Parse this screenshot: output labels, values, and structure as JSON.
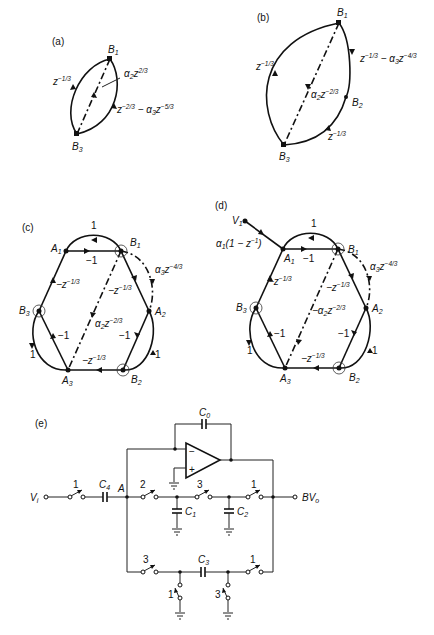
{
  "figure": {
    "panels": [
      {
        "id": "a",
        "label": "(a)",
        "nodes": [
          "B1",
          "B3"
        ],
        "edges": [
          {
            "from": "B3",
            "to": "B1",
            "gain": "z^(-1/3)",
            "style": "solid"
          },
          {
            "from": "B1",
            "to": "B3",
            "gain": "α2 z^(2/3)",
            "style": "dashed"
          },
          {
            "from": "B1",
            "to": "B3",
            "gain": "z^(-2/3) − α3 z^(-5/3)",
            "style": "solid"
          }
        ]
      },
      {
        "id": "b",
        "label": "(b)",
        "nodes": [
          "B1",
          "B2",
          "B3"
        ],
        "edges": [
          {
            "from": "B3",
            "to": "B1",
            "gain": "z^(-1/3)",
            "style": "solid"
          },
          {
            "from": "B1",
            "to": "B3",
            "gain": "α2 z^(-2/3)",
            "style": "dashed"
          },
          {
            "from": "B1",
            "to": "B2",
            "gain": "z^(-1/3) − α3 z^(-4/3)",
            "style": "solid"
          },
          {
            "from": "B2",
            "to": "B3",
            "gain": "z^(-1/3)",
            "style": "solid"
          }
        ]
      },
      {
        "id": "c",
        "label": "(c)",
        "nodes": [
          "A1",
          "A2",
          "A3",
          "B1",
          "B2",
          "B3"
        ],
        "circled_nodes": [
          "B1",
          "B2",
          "B3"
        ],
        "edges": [
          {
            "from": "A1",
            "to": "B1",
            "gain": "−1"
          },
          {
            "from": "B1",
            "to": "A1",
            "gain": "1"
          },
          {
            "from": "B1",
            "to": "A2",
            "gain": "−z^(-1/3)"
          },
          {
            "from": "B1",
            "to": "A2",
            "gain": "α3 z^(-4/3)",
            "style": "dashed"
          },
          {
            "from": "B1",
            "to": "A3",
            "gain": "α2 z^(-2/3)",
            "style": "dashed"
          },
          {
            "from": "A2",
            "to": "B2",
            "gain": "−1"
          },
          {
            "from": "B2",
            "to": "A2",
            "gain": "1"
          },
          {
            "from": "B2",
            "to": "A3",
            "gain": "−z^(-1/3)"
          },
          {
            "from": "A3",
            "to": "B3",
            "gain": "−1"
          },
          {
            "from": "B3",
            "to": "A3",
            "gain": "1"
          },
          {
            "from": "B3",
            "to": "A1",
            "gain": "−z^(-1/3)"
          }
        ]
      },
      {
        "id": "d",
        "label": "(d)",
        "nodes": [
          "V1",
          "A1",
          "A2",
          "A3",
          "B1",
          "B2",
          "B3"
        ],
        "circled_nodes": [
          "B1",
          "B2",
          "B3"
        ],
        "edges": [
          {
            "from": "V1",
            "to": "A1",
            "gain": "α1(1 − z^(-1))"
          },
          {
            "from": "A1",
            "to": "B1",
            "gain": "−1"
          },
          {
            "from": "B1",
            "to": "A1",
            "gain": "1"
          },
          {
            "from": "B1",
            "to": "A2",
            "gain": "−z^(-1/3)"
          },
          {
            "from": "B1",
            "to": "A2",
            "gain": "α3 z^(-4/3)",
            "style": "dashed"
          },
          {
            "from": "B1",
            "to": "A3",
            "gain": "−α2 z^(-2/3)",
            "style": "dashed"
          },
          {
            "from": "A2",
            "to": "B2",
            "gain": "−1"
          },
          {
            "from": "B2",
            "to": "A2",
            "gain": "1"
          },
          {
            "from": "B2",
            "to": "A3",
            "gain": "−z^(-1/3)"
          },
          {
            "from": "A3",
            "to": "B3",
            "gain": "−1"
          },
          {
            "from": "B3",
            "to": "A3",
            "gain": "1"
          },
          {
            "from": "B3",
            "to": "A1",
            "gain": "−z^(-1/3)"
          }
        ]
      },
      {
        "id": "e",
        "label": "(e)",
        "type": "switched-capacitor circuit",
        "input": "Vi",
        "output": "BVo",
        "node_label": "A",
        "capacitors": [
          "C0",
          "C1",
          "C2",
          "C3",
          "C4"
        ],
        "switch_phases": {
          "input_switch": "1",
          "a_to_c1": "2",
          "c1_to_c2": "3",
          "c2_to_out": "1",
          "bottom_left": "3",
          "bottom_right": "1",
          "c3_left_ground": "1",
          "c3_right_ground": "3"
        },
        "opamp_inputs": [
          "−",
          "+"
        ]
      }
    ]
  },
  "labels": {
    "a": {
      "panel": "(a)",
      "b1": "B",
      "b1s": "1",
      "b3": "B",
      "b3s": "3",
      "e1": "z",
      "e1p": "−1/3",
      "e2a": "α",
      "e2s": "2",
      "e2z": "z",
      "e2p": "2/3",
      "e3z": "z",
      "e3p": "−2/3",
      "e3m": " − α",
      "e3s": "3",
      "e3z2": "z",
      "e3p2": "−5/3"
    },
    "b": {
      "panel": "(b)",
      "b1": "B",
      "b1s": "1",
      "b2": "B",
      "b2s": "2",
      "b3": "B",
      "b3s": "3",
      "e1": "z",
      "e1p": "−1/3",
      "e2a": "α",
      "e2s": "2",
      "e2z": "z",
      "e2p": "−2/3",
      "e3z": "z",
      "e3p": "−1/3",
      "e3m": " − α",
      "e3s": "3",
      "e3z2": "z",
      "e3p2": "−4/3",
      "e4z": "z",
      "e4p": "−1/3"
    },
    "c": {
      "panel": "(c)",
      "A": "A",
      "B": "B",
      "s1": "1",
      "s2": "2",
      "s3": "3",
      "one": "1",
      "m1": "−1",
      "mz": "−z",
      "p13": "−1/3",
      "p43": "−4/3",
      "p23": "−2/3",
      "alpha": "α",
      "z": "z"
    },
    "d": {
      "panel": "(d)",
      "A": "A",
      "B": "B",
      "V": "V",
      "s1": "1",
      "s2": "2",
      "s3": "3",
      "one": "1",
      "m1": "−1",
      "mz": "−z",
      "p13": "−1/3",
      "p43": "−4/3",
      "p23": "−2/3",
      "alpha": "α",
      "malpha": "−α",
      "z": "z",
      "inGain1": "α",
      "inGain2": "(1 − ",
      "inGain3": "z",
      "inGain4": "−1",
      "inGain5": ")"
    },
    "e": {
      "panel": "(e)",
      "vi": "V",
      "vis": "i",
      "bvo": "BV",
      "bvos": "o",
      "A": "A",
      "C": "C",
      "c0": "0",
      "c1": "1",
      "c2": "2",
      "c3": "3",
      "c4": "4",
      "minus": "−",
      "plus": "+",
      "ph1": "1",
      "ph2": "2",
      "ph3": "3"
    }
  }
}
